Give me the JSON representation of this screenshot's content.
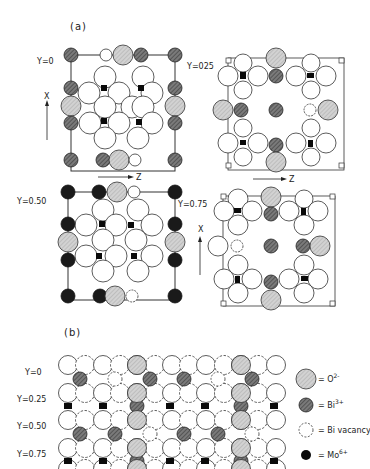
{
  "figure": {
    "panel_a_label": "(a)",
    "panel_b_label": "(b)",
    "colors": {
      "background": "#ffffff",
      "outline": "#333333",
      "oxygen_fill": "#c8c8c8",
      "bismuth_fill": "#6e6e6e",
      "molybdenum_fill": "#0a0a0a",
      "vacancy_fill": "#ffffff"
    }
  },
  "panel_a": {
    "layers": [
      {
        "id": "y0",
        "label": "Y=0",
        "axis_x": "X",
        "axis_z": "Z"
      },
      {
        "id": "y025",
        "label": "Y=025"
      },
      {
        "id": "y050",
        "label": "Y=0.50"
      },
      {
        "id": "y075",
        "label": "Y=0.75",
        "axis_x": "X",
        "axis_z": "Z"
      }
    ]
  },
  "panel_b": {
    "row_labels": [
      "Y=0",
      "Y=0.25",
      "Y=0.50",
      "Y=0.75"
    ]
  },
  "legend": {
    "items": [
      {
        "symbol": "oxygen",
        "text": "= O",
        "sup": "2-"
      },
      {
        "symbol": "bismuth",
        "text": "= Bi",
        "sup": "3+"
      },
      {
        "symbol": "vacancy",
        "text": "= Bi vacancy",
        "sup": ""
      },
      {
        "symbol": "molybdenum",
        "text": "= Mo",
        "sup": "6+"
      }
    ]
  }
}
